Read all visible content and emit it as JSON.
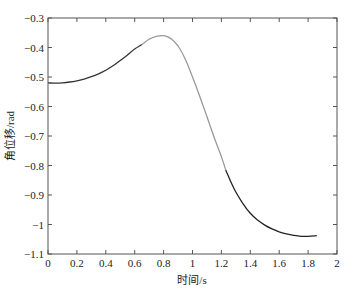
{
  "chart_data": {
    "type": "line",
    "title": "",
    "xlabel": "时间/s",
    "ylabel": "角位移/rad",
    "xlim": [
      0,
      2
    ],
    "ylim": [
      -1.1,
      -0.3
    ],
    "xticks": [
      0,
      0.2,
      0.4,
      0.6,
      0.8,
      1,
      1.2,
      1.4,
      1.6,
      1.8,
      2
    ],
    "xtick_labels": [
      "0",
      "0.2",
      "0.4",
      "0.6",
      "0.8",
      "1",
      "1.2",
      "1.4",
      "1.6",
      "1.8",
      "2"
    ],
    "yticks": [
      -0.3,
      -0.4,
      -0.5,
      -0.6,
      -0.7,
      -0.8,
      -0.9,
      -1,
      -1.1
    ],
    "ytick_labels": [
      "-0.3",
      "-0.4",
      "-0.5",
      "-0.6",
      "-0.7",
      "-0.8",
      "-0.9",
      "-1",
      "-1.1"
    ],
    "grid": false,
    "legend": null,
    "series": [
      {
        "name": "segment-1",
        "color": "#333333",
        "x": [
          0,
          0.05,
          0.1,
          0.15,
          0.2,
          0.25,
          0.3,
          0.35,
          0.4,
          0.45,
          0.5,
          0.55,
          0.6,
          0.65
        ],
        "y": [
          -0.52,
          -0.521,
          -0.52,
          -0.517,
          -0.513,
          -0.507,
          -0.499,
          -0.489,
          -0.477,
          -0.462,
          -0.444,
          -0.425,
          -0.405,
          -0.39
        ]
      },
      {
        "name": "segment-2",
        "color": "#999999",
        "x": [
          0.65,
          0.7,
          0.75,
          0.8,
          0.85,
          0.9,
          0.95,
          1.0,
          1.05,
          1.1,
          1.15,
          1.2,
          1.23
        ],
        "y": [
          -0.39,
          -0.372,
          -0.362,
          -0.36,
          -0.37,
          -0.395,
          -0.44,
          -0.5,
          -0.565,
          -0.635,
          -0.705,
          -0.77,
          -0.815
        ]
      },
      {
        "name": "segment-3",
        "color": "#222222",
        "x": [
          1.23,
          1.27,
          1.3,
          1.35,
          1.4,
          1.45,
          1.5,
          1.55,
          1.6,
          1.65,
          1.7,
          1.75,
          1.8,
          1.86
        ],
        "y": [
          -0.815,
          -0.86,
          -0.89,
          -0.93,
          -0.962,
          -0.985,
          -1.002,
          -1.015,
          -1.025,
          -1.032,
          -1.037,
          -1.04,
          -1.04,
          -1.038
        ]
      }
    ]
  }
}
